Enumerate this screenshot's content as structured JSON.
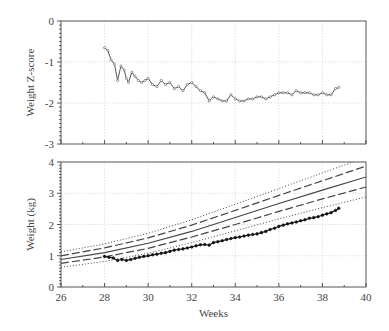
{
  "chart_data": [
    {
      "type": "line",
      "panel": "top",
      "title": "",
      "xlabel": "",
      "ylabel": "Weight Z-score",
      "xlim": [
        26,
        40
      ],
      "ylim": [
        -3,
        0
      ],
      "yticks": [
        0,
        -1,
        -2,
        -3
      ],
      "yticklabels": [
        "0",
        "-1",
        "-2",
        "-3"
      ],
      "xticks": [
        26,
        28,
        30,
        32,
        34,
        36,
        38,
        40
      ],
      "grid": true,
      "series": [
        {
          "name": "Weight Z-score",
          "marker": "small-circle",
          "x": [
            28.0,
            28.15,
            28.3,
            28.45,
            28.6,
            28.75,
            28.9,
            29.0,
            29.1,
            29.25,
            29.4,
            29.55,
            29.7,
            29.85,
            30.0,
            30.2,
            30.4,
            30.6,
            30.8,
            31.0,
            31.2,
            31.4,
            31.6,
            31.8,
            32.0,
            32.2,
            32.4,
            32.6,
            32.8,
            33.0,
            33.2,
            33.4,
            33.6,
            33.8,
            34.0,
            34.2,
            34.4,
            34.6,
            34.8,
            35.0,
            35.2,
            35.4,
            35.6,
            35.8,
            36.0,
            36.2,
            36.4,
            36.6,
            36.8,
            37.0,
            37.2,
            37.4,
            37.6,
            37.8,
            38.0,
            38.2,
            38.4,
            38.6,
            38.75
          ],
          "values": [
            -0.65,
            -0.72,
            -0.95,
            -1.05,
            -1.45,
            -1.1,
            -1.2,
            -1.4,
            -1.5,
            -1.25,
            -1.35,
            -1.45,
            -1.5,
            -1.45,
            -1.4,
            -1.55,
            -1.6,
            -1.45,
            -1.55,
            -1.5,
            -1.65,
            -1.6,
            -1.7,
            -1.55,
            -1.5,
            -1.6,
            -1.7,
            -1.75,
            -1.95,
            -1.85,
            -1.9,
            -1.95,
            -1.95,
            -1.8,
            -1.9,
            -1.95,
            -1.95,
            -1.9,
            -1.9,
            -1.85,
            -1.85,
            -1.9,
            -1.85,
            -1.8,
            -1.75,
            -1.75,
            -1.75,
            -1.8,
            -1.7,
            -1.75,
            -1.75,
            -1.75,
            -1.8,
            -1.8,
            -1.75,
            -1.8,
            -1.8,
            -1.65,
            -1.62
          ]
        }
      ]
    },
    {
      "type": "line",
      "panel": "bottom",
      "title": "",
      "xlabel": "Weeks",
      "ylabel": "Weight (kg)",
      "xlim": [
        26,
        40
      ],
      "ylim": [
        0,
        4
      ],
      "yticks": [
        0,
        1,
        2,
        3,
        4
      ],
      "yticklabels": [
        "0",
        "1",
        "2",
        "3",
        "4"
      ],
      "xticks": [
        26,
        28,
        30,
        32,
        34,
        36,
        38,
        40
      ],
      "xticklabels": [
        "26",
        "28",
        "30",
        "32",
        "34",
        "36",
        "38",
        "40"
      ],
      "grid": true,
      "series": [
        {
          "name": "+2 SD",
          "style": "dotted",
          "x": [
            26,
            28,
            30,
            32,
            34,
            36,
            38,
            40
          ],
          "values": [
            1.12,
            1.38,
            1.72,
            2.15,
            2.65,
            3.15,
            3.65,
            4.15
          ]
        },
        {
          "name": "+1 SD",
          "style": "dashed",
          "x": [
            26,
            28,
            30,
            32,
            34,
            36,
            38,
            40
          ],
          "values": [
            1.0,
            1.25,
            1.57,
            1.98,
            2.45,
            2.93,
            3.4,
            3.87
          ]
        },
        {
          "name": "Median",
          "style": "solid",
          "x": [
            26,
            28,
            30,
            32,
            34,
            36,
            38,
            40
          ],
          "values": [
            0.88,
            1.1,
            1.4,
            1.78,
            2.22,
            2.67,
            3.1,
            3.52
          ]
        },
        {
          "name": "-1 SD",
          "style": "dashed",
          "x": [
            26,
            28,
            30,
            32,
            34,
            36,
            38,
            40
          ],
          "values": [
            0.76,
            0.96,
            1.24,
            1.6,
            2.0,
            2.42,
            2.82,
            3.2
          ]
        },
        {
          "name": "-2 SD",
          "style": "dotted",
          "x": [
            26,
            28,
            30,
            32,
            34,
            36,
            38,
            40
          ],
          "values": [
            0.63,
            0.82,
            1.08,
            1.42,
            1.8,
            2.18,
            2.54,
            2.88
          ]
        },
        {
          "name": "Infant weight",
          "style": "solid-markers",
          "x": [
            28.0,
            28.2,
            28.4,
            28.6,
            28.8,
            29.0,
            29.2,
            29.4,
            29.6,
            29.8,
            30.0,
            30.2,
            30.4,
            30.6,
            30.8,
            31.0,
            31.2,
            31.4,
            31.6,
            31.8,
            32.0,
            32.2,
            32.4,
            32.6,
            32.8,
            33.0,
            33.2,
            33.4,
            33.6,
            33.8,
            34.0,
            34.2,
            34.4,
            34.6,
            34.8,
            35.0,
            35.2,
            35.4,
            35.6,
            35.8,
            36.0,
            36.2,
            36.4,
            36.6,
            36.8,
            37.0,
            37.2,
            37.4,
            37.6,
            37.8,
            38.0,
            38.2,
            38.4,
            38.6,
            38.75
          ],
          "values": [
            0.98,
            0.95,
            0.93,
            0.85,
            0.88,
            0.85,
            0.88,
            0.92,
            0.95,
            0.98,
            1.0,
            1.03,
            1.05,
            1.08,
            1.1,
            1.14,
            1.18,
            1.2,
            1.22,
            1.25,
            1.28,
            1.32,
            1.35,
            1.36,
            1.34,
            1.42,
            1.45,
            1.48,
            1.52,
            1.55,
            1.58,
            1.6,
            1.63,
            1.66,
            1.68,
            1.7,
            1.74,
            1.78,
            1.84,
            1.88,
            1.94,
            1.98,
            2.02,
            2.05,
            2.08,
            2.12,
            2.15,
            2.2,
            2.22,
            2.25,
            2.3,
            2.34,
            2.38,
            2.45,
            2.52
          ]
        }
      ]
    }
  ]
}
